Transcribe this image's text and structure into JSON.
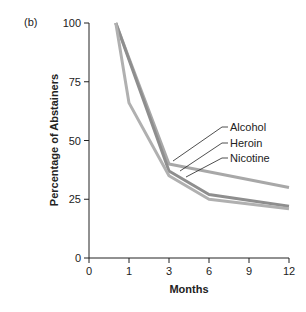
{
  "panel_label": "(b)",
  "chart_data": {
    "type": "line",
    "title": "",
    "xlabel": "Months",
    "ylabel": "Percentage of Abstainers",
    "x_ticks": [
      "0",
      "1",
      "3",
      "6",
      "9",
      "12"
    ],
    "y_ticks": [
      "0",
      "25",
      "50",
      "75",
      "100"
    ],
    "ylim": [
      0,
      100
    ],
    "x_scale_note": "categorical-like spacing: 0,1,3,6,9,12 equally spaced",
    "grid": false,
    "legend_position": "inline labels with leader lines, right-center",
    "series": [
      {
        "name": "Alcohol",
        "x": [
          0.67,
          1,
          3,
          12
        ],
        "values": [
          100,
          85,
          40,
          30
        ]
      },
      {
        "name": "Heroin",
        "x": [
          0.67,
          3,
          6,
          12
        ],
        "values": [
          100,
          37,
          27,
          22
        ]
      },
      {
        "name": "Nicotine",
        "x": [
          0.67,
          1,
          3,
          6,
          12
        ],
        "values": [
          100,
          66,
          35,
          25,
          21
        ]
      }
    ],
    "line_color": "#9a9a9a"
  }
}
